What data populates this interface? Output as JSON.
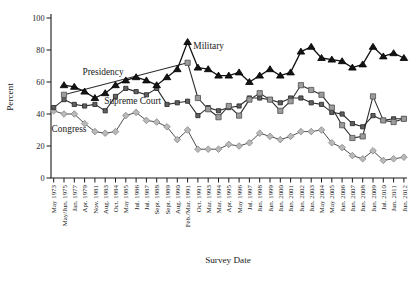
{
  "chart_data": {
    "type": "line",
    "title": "",
    "xlabel": "Survey Date",
    "ylabel": "Percent",
    "ylim": [
      0,
      100
    ],
    "yticks": [
      0,
      20,
      40,
      60,
      80,
      100
    ],
    "grid": false,
    "background": "#ffffff",
    "axis_color": "#1a1a1a",
    "legend_position": "inline-annotations",
    "categories": [
      "May 1973",
      "May/Jun. 1975",
      "Jan. 1977",
      "Apr. 1979",
      "Nov. 1981",
      "Aug. 1983",
      "Oct. 1984",
      "May 1985",
      "Jul. 1986",
      "Jul. 1987",
      "Sept. 1988",
      "Sept. 1989",
      "Aug. 1990",
      "Feb./Mar. 1991",
      "Oct. 1991",
      "Mar. 1993",
      "Mar. 1994",
      "Apr. 1995",
      "May 1996",
      "Jul. 1997",
      "Jun. 1998",
      "Jun. 1999",
      "Jun. 2000",
      "Jun. 2001",
      "Jun. 2002",
      "Jun. 2003",
      "May 2004",
      "May 2005",
      "Jun. 2006",
      "Jun. 2007",
      "Jun. 2008",
      "Jun. 2009",
      "Jul. 2010",
      "Jun. 2011",
      "Jun. 2012"
    ],
    "series": [
      {
        "name": "Congress",
        "marker": "diamond",
        "line_color": "#4d4d4d",
        "line_width": 1.0,
        "marker_fill": "#b9b9b9",
        "marker_stroke": "#878787",
        "values": [
          42,
          40,
          40,
          34,
          29,
          28,
          29,
          39,
          41,
          36,
          35,
          32,
          24,
          30,
          18,
          18,
          18,
          21,
          20,
          22,
          28,
          26,
          24,
          26,
          29,
          29,
          30,
          22,
          19,
          14,
          12,
          17,
          11,
          12,
          13
        ]
      },
      {
        "name": "Supreme Court",
        "marker": "square-small",
        "line_color": "#2e2e2e",
        "line_width": 1.1,
        "marker_fill": "#606060",
        "marker_stroke": "#262626",
        "values": [
          44,
          49,
          46,
          45,
          46,
          42,
          51,
          56,
          54,
          52,
          56,
          46,
          47,
          48,
          39,
          44,
          42,
          44,
          45,
          50,
          50,
          49,
          47,
          50,
          50,
          47,
          46,
          41,
          40,
          34,
          32,
          39,
          36,
          37,
          37
        ]
      },
      {
        "name": "Presidency",
        "marker": "square",
        "line_color": "#2e2e2e",
        "line_width": 1.1,
        "marker_fill": "#9c9c9c",
        "marker_stroke": "#4f4f4f",
        "values": [
          null,
          52,
          null,
          null,
          null,
          null,
          null,
          null,
          null,
          null,
          null,
          null,
          null,
          72,
          50,
          43,
          38,
          45,
          39,
          49,
          53,
          49,
          42,
          48,
          58,
          55,
          52,
          44,
          33,
          25,
          26,
          51,
          36,
          35,
          37
        ]
      },
      {
        "name": "Military",
        "marker": "triangle",
        "line_color": "#141414",
        "line_width": 1.3,
        "marker_fill": "#141414",
        "marker_stroke": "#000000",
        "values": [
          null,
          58,
          57,
          54,
          50,
          53,
          58,
          61,
          63,
          61,
          58,
          63,
          68,
          85,
          69,
          68,
          64,
          64,
          66,
          60,
          64,
          68,
          64,
          66,
          79,
          82,
          75,
          74,
          73,
          69,
          71,
          82,
          76,
          78,
          75
        ]
      }
    ],
    "annotations": [
      {
        "text": "Military",
        "x_index": 13.55,
        "value": 80.5
      },
      {
        "text": "Presidency",
        "x_index": 2.8,
        "value": 64.5
      },
      {
        "text": "Supreme Court",
        "x_index": 4.9,
        "value": 46
      },
      {
        "text": "Congress",
        "x_index": -0.2,
        "value": 28.5
      }
    ]
  }
}
